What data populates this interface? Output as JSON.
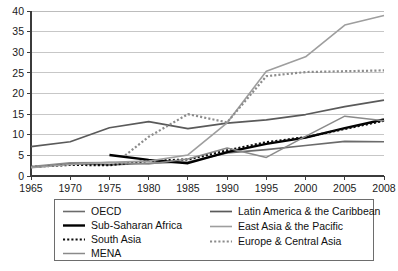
{
  "chart_data": {
    "type": "line",
    "title": "",
    "xlabel": "",
    "ylabel": "",
    "xlim": [
      1965,
      2008
    ],
    "ylim": [
      0,
      40
    ],
    "grid": true,
    "legend_position": "bottom",
    "x_ticks": [
      "1965",
      "1970",
      "1975",
      "1980",
      "1985",
      "1990",
      "1995",
      "2000",
      "2005",
      "2008"
    ],
    "y_ticks": [
      "0",
      "5",
      "10",
      "15",
      "20",
      "25",
      "30",
      "35",
      "40"
    ],
    "series": [
      {
        "name": "OECD",
        "style": "solid",
        "color": "#6b6b6b",
        "width": 1.6,
        "x": [
          1965,
          1970,
          1975,
          1980,
          1985,
          1990,
          1995,
          2000,
          2005,
          2008
        ],
        "values": [
          2.1,
          3.0,
          2.7,
          3.1,
          3.4,
          5.6,
          6.4,
          7.4,
          8.4,
          8.3
        ]
      },
      {
        "name": "Sub-Saharan Africa",
        "style": "solid",
        "color": "#000000",
        "width": 2.4,
        "x": [
          1975,
          1980,
          1985,
          1990,
          1995,
          2000,
          2005,
          2008
        ],
        "values": [
          5.1,
          3.9,
          3.1,
          5.8,
          7.8,
          9.3,
          11.6,
          13.7
        ]
      },
      {
        "name": "South Asia",
        "style": "dotted",
        "color": "#0d0d0d",
        "width": 2.2,
        "x": [
          1965,
          1970,
          1975,
          1980,
          1985,
          1990,
          1995,
          2000,
          2005,
          2008
        ],
        "values": [
          2.2,
          2.7,
          2.6,
          3.7,
          4.0,
          6.2,
          8.2,
          9.4,
          11.4,
          13.4
        ]
      },
      {
        "name": "MENA",
        "style": "solid",
        "color": "#8a8a8a",
        "width": 1.5,
        "x": [
          1965,
          1970,
          1975,
          1980,
          1985,
          1990,
          1995,
          2000,
          2005,
          2008
        ],
        "values": [
          2.3,
          3.2,
          3.3,
          2.9,
          4.1,
          6.8,
          4.5,
          9.6,
          14.5,
          13.4
        ]
      },
      {
        "name": "Latin America & the Caribbean",
        "style": "solid",
        "color": "#5a5a5a",
        "width": 1.7,
        "x": [
          1965,
          1970,
          1975,
          1980,
          1985,
          1990,
          1995,
          2000,
          2005,
          2008
        ],
        "values": [
          7.1,
          8.3,
          11.7,
          13.2,
          11.5,
          12.8,
          13.6,
          14.9,
          16.8,
          18.4
        ]
      },
      {
        "name": "East Asia & the Pacific",
        "style": "solid",
        "color": "#9e9e9e",
        "width": 1.6,
        "x": [
          1965,
          1970,
          1975,
          1980,
          1985,
          1990,
          1995,
          2000,
          2005,
          2008
        ],
        "values": [
          2.0,
          2.8,
          3.3,
          3.6,
          5.1,
          12.9,
          25.4,
          28.9,
          36.6,
          38.9
        ]
      },
      {
        "name": "Europe & Central Asia",
        "style": "dotted",
        "color": "#8c8c8c",
        "width": 2.2,
        "x": [
          1977,
          1980,
          1985,
          1990,
          1995,
          2000,
          2005,
          2008
        ],
        "values": [
          5.0,
          9.5,
          15.0,
          13.0,
          24.2,
          25.2,
          25.4,
          25.6
        ]
      }
    ]
  },
  "legend": {
    "columns": [
      {
        "items": [
          {
            "label": "OECD",
            "key": "OECD"
          },
          {
            "label": "Sub-Saharan Africa",
            "key": "Sub-Saharan Africa"
          },
          {
            "label": "South Asia",
            "key": "South Asia"
          },
          {
            "label": "MENA",
            "key": "MENA"
          }
        ]
      },
      {
        "items": [
          {
            "label": "Latin America & the Caribbean",
            "key": "Latin America & the Caribbean"
          },
          {
            "label": "East Asia & the Pacific",
            "key": "East Asia & the Pacific"
          },
          {
            "label": "Europe & Central Asia",
            "key": "Europe & Central Asia"
          }
        ]
      }
    ]
  }
}
